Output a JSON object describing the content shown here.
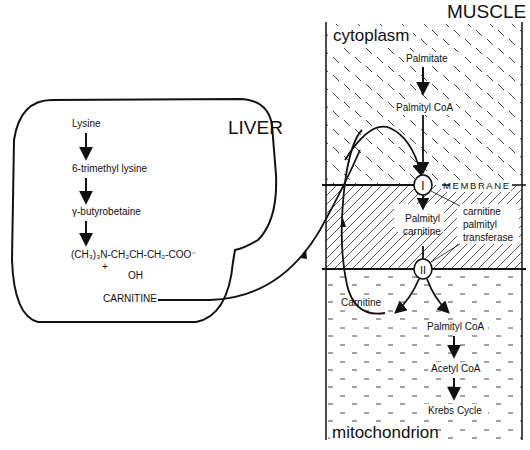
{
  "liver": {
    "title": "LIVER",
    "pathway": [
      "Lysine",
      "6-trimethyl lysine",
      "γ-butyrobetaine"
    ],
    "formula": {
      "main": "(CH₃)₃N-CH₂CH-CH₂-COO⁻",
      "charge": "+",
      "oh": "OH"
    },
    "product": "CARNITINE"
  },
  "muscle": {
    "title": "MUSCLE",
    "cytoplasm": {
      "label": "cytoplasm",
      "steps": [
        "Palmitate",
        "Palmityl CoA"
      ]
    },
    "membrane": {
      "label": "MEMBRANE",
      "intermediate_line1": "Palmityl",
      "intermediate_line2": "carnitine",
      "enzyme_line1": "carnitine",
      "enzyme_line2": "palmityl",
      "enzyme_line3": "transferase",
      "site_1": "I",
      "site_2": "II"
    },
    "mitochondrion": {
      "label": "mitochondrion",
      "carnitine": "Carnitine",
      "steps": [
        "Palmityl CoA",
        "Acetyl CoA",
        "Krebs Cycle"
      ]
    }
  },
  "colors": {
    "ink": "#111111",
    "background": "#ffffff"
  }
}
